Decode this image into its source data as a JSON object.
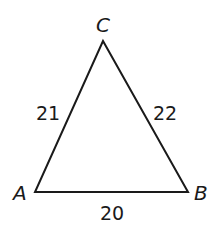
{
  "figure": {
    "type": "triangle",
    "vertices": {
      "A": {
        "label": "A"
      },
      "B": {
        "label": "B"
      },
      "C": {
        "label": "C"
      }
    },
    "sides": {
      "AC": {
        "label": "21"
      },
      "BC": {
        "label": "22"
      },
      "AB": {
        "label": "20"
      }
    },
    "colors": {
      "stroke": "#1a1a1a",
      "background": "#ffffff"
    }
  }
}
